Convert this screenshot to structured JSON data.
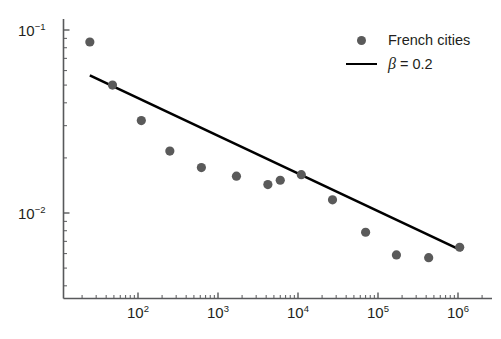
{
  "chart_data": {
    "type": "scatter",
    "title": "",
    "xlabel": "",
    "ylabel": "",
    "xscale": "log",
    "yscale": "log",
    "xlim": [
      18,
      1600000
    ],
    "ylim": [
      0.0042,
      0.115
    ],
    "grid": false,
    "legend_position": "top-right",
    "xtick_labels": [
      "10^2",
      "10^3",
      "10^4",
      "10^5",
      "10^6"
    ],
    "xtick_values": [
      100,
      1000,
      10000,
      100000,
      1000000
    ],
    "ytick_labels": [
      "10^-1",
      "10^-2"
    ],
    "ytick_values": [
      0.1,
      0.01
    ],
    "series": [
      {
        "name": "French cities",
        "type": "scatter",
        "color": "#5a5a5a",
        "marker": "circle",
        "x": [
          25,
          48,
          110,
          250,
          620,
          1700,
          4200,
          6000,
          11000,
          27000,
          70000,
          170000,
          430000,
          1050000
        ],
        "y": [
          0.086,
          0.05,
          0.032,
          0.0218,
          0.0177,
          0.0159,
          0.0143,
          0.0151,
          0.0162,
          0.0118,
          0.00785,
          0.0059,
          0.0057,
          0.0065
        ]
      },
      {
        "name": "beta = 0.2",
        "type": "line",
        "color": "#000000",
        "slope": -0.2,
        "x": [
          25,
          1100000
        ],
        "y": [
          0.0565,
          0.00625
        ]
      }
    ]
  },
  "legend": {
    "items": [
      {
        "label": "French cities",
        "marker": "dot",
        "color": "#5a5a5a"
      },
      {
        "label_symbol": "β",
        "label_rest": "= 0.2",
        "marker": "line",
        "color": "#000000"
      }
    ]
  },
  "axes": {
    "x_labels": [
      {
        "base": "10",
        "exp": "2"
      },
      {
        "base": "10",
        "exp": "3"
      },
      {
        "base": "10",
        "exp": "4"
      },
      {
        "base": "10",
        "exp": "5"
      },
      {
        "base": "10",
        "exp": "6"
      }
    ],
    "y_labels": [
      {
        "base": "10",
        "exp": "−1"
      },
      {
        "base": "10",
        "exp": "−2"
      }
    ]
  },
  "colors": {
    "marker": "#5a5a5a",
    "line": "#000000",
    "axis": "#58595b",
    "text": "#231f20",
    "background": "#ffffff"
  }
}
